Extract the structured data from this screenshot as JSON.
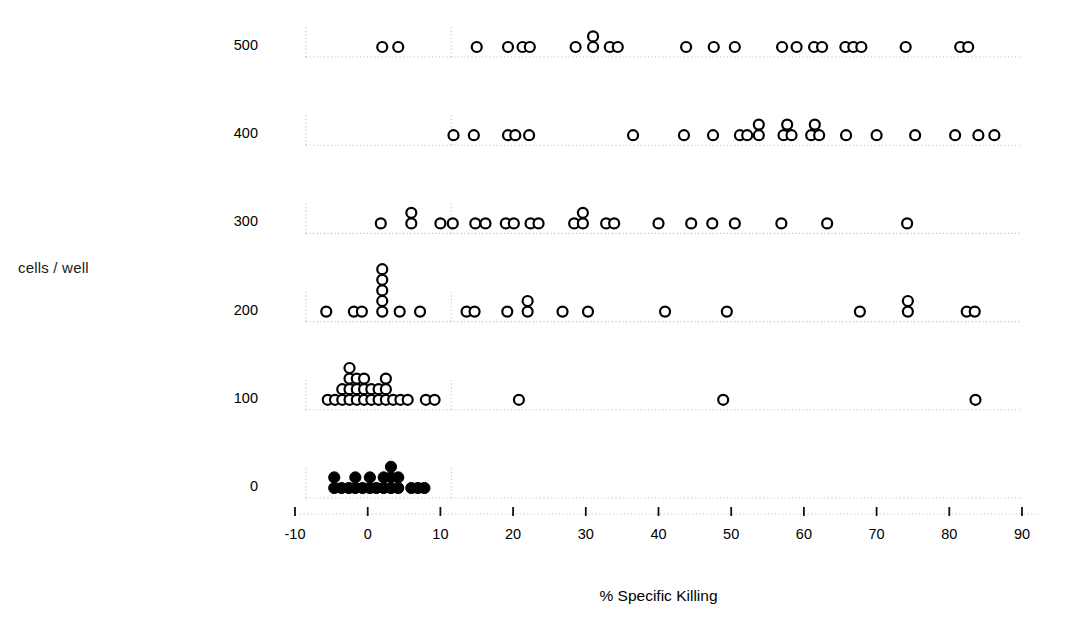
{
  "figure": {
    "width": 1067,
    "height": 631,
    "background": "#ffffff",
    "marker_color": "#000000",
    "gridline_color": "#b9b9b9"
  },
  "chart_data": {
    "type": "scatter",
    "title": "",
    "xlabel": "% Specific Killing",
    "ylabel": "cells / well",
    "xlim": [
      -12,
      92
    ],
    "ylim": [
      -60,
      560
    ],
    "grid": true,
    "legend": false,
    "xticks": [
      -10,
      0,
      10,
      20,
      30,
      40,
      50,
      60,
      70,
      80,
      90
    ],
    "xtick_labels": [
      "-10",
      "0",
      "10",
      "20",
      "30",
      "40",
      "50",
      "60",
      "70",
      "80",
      "90"
    ],
    "yticks": [
      0,
      100,
      200,
      300,
      400,
      500
    ],
    "ytick_labels": [
      "0",
      "100",
      "200",
      "300",
      "400",
      "500"
    ],
    "series": [
      {
        "name": "500 cells / well",
        "y": 500,
        "marker": "open-circle",
        "points": [
          {
            "x": 2.0,
            "stack": 1
          },
          {
            "x": 4.2,
            "stack": 1
          },
          {
            "x": 15.0,
            "stack": 1
          },
          {
            "x": 19.3,
            "stack": 1
          },
          {
            "x": 21.3,
            "stack": 1
          },
          {
            "x": 22.3,
            "stack": 1
          },
          {
            "x": 28.6,
            "stack": 1
          },
          {
            "x": 31.0,
            "stack": 1
          },
          {
            "x": 31.0,
            "stack": 2
          },
          {
            "x": 33.3,
            "stack": 1
          },
          {
            "x": 34.4,
            "stack": 1
          },
          {
            "x": 43.8,
            "stack": 1
          },
          {
            "x": 47.6,
            "stack": 1
          },
          {
            "x": 50.5,
            "stack": 1
          },
          {
            "x": 57.0,
            "stack": 1
          },
          {
            "x": 59.0,
            "stack": 1
          },
          {
            "x": 61.4,
            "stack": 1
          },
          {
            "x": 62.5,
            "stack": 1
          },
          {
            "x": 65.7,
            "stack": 1
          },
          {
            "x": 66.8,
            "stack": 1
          },
          {
            "x": 67.9,
            "stack": 1
          },
          {
            "x": 74.0,
            "stack": 1
          },
          {
            "x": 81.5,
            "stack": 1
          },
          {
            "x": 82.6,
            "stack": 1
          }
        ]
      },
      {
        "name": "400 cells / well",
        "y": 400,
        "marker": "open-circle",
        "points": [
          {
            "x": 11.8,
            "stack": 1
          },
          {
            "x": 14.6,
            "stack": 1
          },
          {
            "x": 19.3,
            "stack": 1
          },
          {
            "x": 20.3,
            "stack": 1
          },
          {
            "x": 22.2,
            "stack": 1
          },
          {
            "x": 36.5,
            "stack": 1
          },
          {
            "x": 43.5,
            "stack": 1
          },
          {
            "x": 47.5,
            "stack": 1
          },
          {
            "x": 51.2,
            "stack": 1
          },
          {
            "x": 52.2,
            "stack": 1
          },
          {
            "x": 53.8,
            "stack": 1
          },
          {
            "x": 53.8,
            "stack": 2
          },
          {
            "x": 57.2,
            "stack": 1
          },
          {
            "x": 58.3,
            "stack": 1
          },
          {
            "x": 57.7,
            "stack": 2
          },
          {
            "x": 61.0,
            "stack": 1
          },
          {
            "x": 62.1,
            "stack": 1
          },
          {
            "x": 61.5,
            "stack": 2
          },
          {
            "x": 65.8,
            "stack": 1
          },
          {
            "x": 70.0,
            "stack": 1
          },
          {
            "x": 75.3,
            "stack": 1
          },
          {
            "x": 80.8,
            "stack": 1
          },
          {
            "x": 84.0,
            "stack": 1
          },
          {
            "x": 86.2,
            "stack": 1
          }
        ]
      },
      {
        "name": "300 cells / well",
        "y": 300,
        "marker": "open-circle",
        "points": [
          {
            "x": 1.8,
            "stack": 1
          },
          {
            "x": 6.0,
            "stack": 1
          },
          {
            "x": 6.0,
            "stack": 2
          },
          {
            "x": 10.0,
            "stack": 1
          },
          {
            "x": 11.7,
            "stack": 1
          },
          {
            "x": 14.8,
            "stack": 1
          },
          {
            "x": 16.2,
            "stack": 1
          },
          {
            "x": 19.0,
            "stack": 1
          },
          {
            "x": 20.1,
            "stack": 1
          },
          {
            "x": 22.4,
            "stack": 1
          },
          {
            "x": 23.5,
            "stack": 1
          },
          {
            "x": 28.4,
            "stack": 1
          },
          {
            "x": 29.6,
            "stack": 1
          },
          {
            "x": 29.6,
            "stack": 2
          },
          {
            "x": 32.8,
            "stack": 1
          },
          {
            "x": 33.9,
            "stack": 1
          },
          {
            "x": 40.0,
            "stack": 1
          },
          {
            "x": 44.5,
            "stack": 1
          },
          {
            "x": 47.4,
            "stack": 1
          },
          {
            "x": 50.5,
            "stack": 1
          },
          {
            "x": 56.9,
            "stack": 1
          },
          {
            "x": 63.2,
            "stack": 1
          },
          {
            "x": 74.2,
            "stack": 1
          }
        ]
      },
      {
        "name": "200 cells / well",
        "y": 200,
        "marker": "open-circle",
        "points": [
          {
            "x": -5.7,
            "stack": 1
          },
          {
            "x": -1.9,
            "stack": 1
          },
          {
            "x": -0.8,
            "stack": 1
          },
          {
            "x": 2.0,
            "stack": 1
          },
          {
            "x": 2.0,
            "stack": 2
          },
          {
            "x": 2.0,
            "stack": 3
          },
          {
            "x": 2.0,
            "stack": 4
          },
          {
            "x": 2.0,
            "stack": 5
          },
          {
            "x": 4.4,
            "stack": 1
          },
          {
            "x": 7.2,
            "stack": 1
          },
          {
            "x": 13.6,
            "stack": 1
          },
          {
            "x": 14.7,
            "stack": 1
          },
          {
            "x": 19.2,
            "stack": 1
          },
          {
            "x": 22.0,
            "stack": 1
          },
          {
            "x": 22.0,
            "stack": 2
          },
          {
            "x": 26.8,
            "stack": 1
          },
          {
            "x": 30.3,
            "stack": 1
          },
          {
            "x": 40.9,
            "stack": 1
          },
          {
            "x": 49.4,
            "stack": 1
          },
          {
            "x": 67.7,
            "stack": 1
          },
          {
            "x": 74.3,
            "stack": 1
          },
          {
            "x": 74.3,
            "stack": 2
          },
          {
            "x": 82.4,
            "stack": 1
          },
          {
            "x": 83.5,
            "stack": 1
          }
        ]
      },
      {
        "name": "100 cells / well",
        "y": 100,
        "marker": "open-circle",
        "points": [
          {
            "x": -5.5,
            "stack": 1
          },
          {
            "x": -4.5,
            "stack": 1
          },
          {
            "x": -3.5,
            "stack": 1
          },
          {
            "x": -3.5,
            "stack": 2
          },
          {
            "x": -2.5,
            "stack": 1
          },
          {
            "x": -2.5,
            "stack": 2
          },
          {
            "x": -2.5,
            "stack": 3
          },
          {
            "x": -2.5,
            "stack": 4
          },
          {
            "x": -1.5,
            "stack": 1
          },
          {
            "x": -1.5,
            "stack": 2
          },
          {
            "x": -1.5,
            "stack": 3
          },
          {
            "x": -0.5,
            "stack": 1
          },
          {
            "x": -0.5,
            "stack": 2
          },
          {
            "x": -0.5,
            "stack": 3
          },
          {
            "x": 0.5,
            "stack": 1
          },
          {
            "x": 0.5,
            "stack": 2
          },
          {
            "x": 1.5,
            "stack": 1
          },
          {
            "x": 1.5,
            "stack": 2
          },
          {
            "x": 2.5,
            "stack": 1
          },
          {
            "x": 2.5,
            "stack": 2
          },
          {
            "x": 2.5,
            "stack": 3
          },
          {
            "x": 3.5,
            "stack": 1
          },
          {
            "x": 4.5,
            "stack": 1
          },
          {
            "x": 5.5,
            "stack": 1
          },
          {
            "x": 8.0,
            "stack": 1
          },
          {
            "x": 9.2,
            "stack": 1
          },
          {
            "x": 20.8,
            "stack": 1
          },
          {
            "x": 48.9,
            "stack": 1
          },
          {
            "x": 83.6,
            "stack": 1
          }
        ]
      },
      {
        "name": "0 cells / well",
        "y": 0,
        "marker": "filled-circle",
        "points": [
          {
            "x": -4.6,
            "stack": 1
          },
          {
            "x": -4.6,
            "stack": 2
          },
          {
            "x": -3.6,
            "stack": 1
          },
          {
            "x": -2.6,
            "stack": 1
          },
          {
            "x": -1.7,
            "stack": 1
          },
          {
            "x": -1.7,
            "stack": 2
          },
          {
            "x": -0.7,
            "stack": 1
          },
          {
            "x": 0.3,
            "stack": 1
          },
          {
            "x": 0.3,
            "stack": 2
          },
          {
            "x": 1.2,
            "stack": 1
          },
          {
            "x": 2.2,
            "stack": 1
          },
          {
            "x": 2.2,
            "stack": 2
          },
          {
            "x": 3.2,
            "stack": 1
          },
          {
            "x": 3.2,
            "stack": 2
          },
          {
            "x": 3.2,
            "stack": 3
          },
          {
            "x": 4.2,
            "stack": 1
          },
          {
            "x": 4.2,
            "stack": 2
          },
          {
            "x": 6.0,
            "stack": 1
          },
          {
            "x": 6.9,
            "stack": 1
          },
          {
            "x": 7.8,
            "stack": 1
          }
        ]
      }
    ]
  }
}
